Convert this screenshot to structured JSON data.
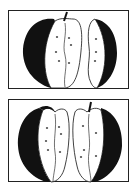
{
  "figure": {
    "panels": [
      {
        "id": "top",
        "description": "Apple cut in two halves: left half with stem, right half slice",
        "alt": "apple-halves-top"
      },
      {
        "id": "bottom",
        "description": "Apple cut in two halves: left half, right half with stem",
        "alt": "apple-halves-bottom"
      }
    ],
    "colors": {
      "ink": "#111111",
      "paper": "#ffffff",
      "frame": "#222222"
    }
  }
}
